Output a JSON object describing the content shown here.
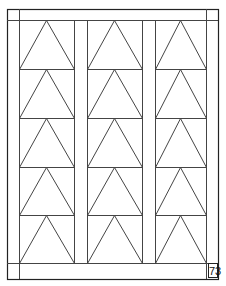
{
  "page": {
    "page_number": "73",
    "colors": {
      "line": "#444444",
      "frame": "#222222",
      "background": "#ffffff"
    }
  },
  "quilt": {
    "pattern": "triangle-columns",
    "columns": 3,
    "rows": 5,
    "frame": {
      "outer": [
        7,
        9,
        218,
        279
      ],
      "inner_top": 20,
      "inner_bottom": 263,
      "inner_left": 19,
      "inner_right": 206
    },
    "column_bounds": [
      [
        19,
        74
      ],
      [
        87,
        142
      ],
      [
        155,
        206
      ]
    ],
    "row_bounds": [
      20,
      69,
      118,
      167,
      215,
      263
    ]
  }
}
